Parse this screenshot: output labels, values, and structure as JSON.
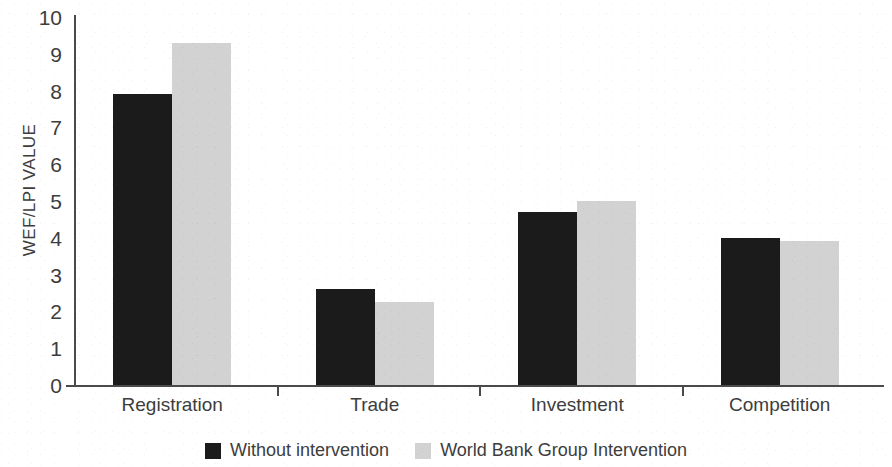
{
  "chart_data": {
    "type": "bar",
    "title": "",
    "subtitle": "",
    "xlabel": "",
    "ylabel": "WEF/LPI VALUE",
    "ylim": [
      0,
      10
    ],
    "yticks": [
      "0",
      "1",
      "2",
      "3",
      "4",
      "5",
      "6",
      "7",
      "8",
      "9",
      "10"
    ],
    "grid": false,
    "legend_position": "bottom-center",
    "categories": [
      "Registration",
      "Trade",
      "Investment",
      "Competition"
    ],
    "series": [
      {
        "name": "Without intervention",
        "color": "#1b1b1b",
        "values": [
          7.9,
          2.6,
          4.7,
          4.0
        ]
      },
      {
        "name": "World Bank Group Intervention",
        "color": "#d2d2d2",
        "values": [
          9.3,
          2.25,
          5.0,
          3.9
        ]
      }
    ]
  }
}
